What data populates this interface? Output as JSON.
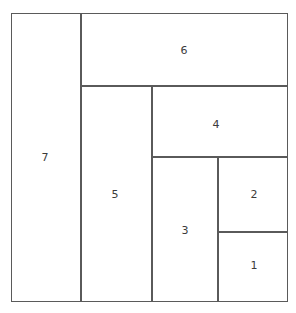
{
  "diagram": {
    "type": "geometric-subdivision",
    "canvas": {
      "width": 296,
      "height": 313
    },
    "outer_frame": {
      "x": 11,
      "y": 13,
      "width": 277,
      "height": 289
    },
    "style": {
      "line_color": "#5a5a5a",
      "line_width": 1,
      "background_color": "#ffffff",
      "label_color": "#3b3b3b",
      "label_font_size": 11
    },
    "rectangles": [
      {
        "label": "1",
        "x": 218,
        "y": 232,
        "width": 70,
        "height": 70,
        "label_x": 254,
        "label_y": 265
      },
      {
        "label": "2",
        "x": 218,
        "y": 157,
        "width": 70,
        "height": 75,
        "label_x": 254,
        "label_y": 194
      },
      {
        "label": "3",
        "x": 152,
        "y": 157,
        "width": 66,
        "height": 145,
        "label_x": 185,
        "label_y": 230
      },
      {
        "label": "4",
        "x": 152,
        "y": 86,
        "width": 136,
        "height": 71,
        "label_x": 216,
        "label_y": 124
      },
      {
        "label": "5",
        "x": 81,
        "y": 86,
        "width": 71,
        "height": 216,
        "label_x": 115,
        "label_y": 194
      },
      {
        "label": "6",
        "x": 81,
        "y": 13,
        "width": 207,
        "height": 73,
        "label_x": 184,
        "label_y": 50
      },
      {
        "label": "7",
        "x": 11,
        "y": 13,
        "width": 70,
        "height": 289,
        "label_x": 45,
        "label_y": 157
      }
    ]
  }
}
